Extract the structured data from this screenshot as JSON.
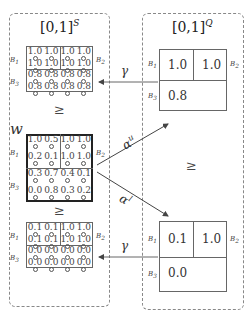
{
  "left_panel": {
    "title": "[0,1]",
    "title_sup": "S",
    "top_grid": {
      "rows": [
        [
          "1.0",
          "1.0",
          "1.0",
          "1.0"
        ],
        [
          "1.0",
          "1.0",
          "1.0",
          "1.0"
        ],
        [
          "0.8",
          "0.8",
          "0.8",
          "0.8"
        ],
        [
          "0.8",
          "0.8",
          "0.8",
          "0.8"
        ]
      ]
    },
    "leq_1": "≥",
    "w_label": "w",
    "w_grid": {
      "rows": [
        [
          "1.0",
          "0.5",
          "1.0",
          "1.0"
        ],
        [
          "0.2",
          "0.1",
          "1.0",
          "1.0"
        ],
        [
          "0.3",
          "0.7",
          "0.4",
          "0.1"
        ],
        [
          "0.0",
          "0.8",
          "0.3",
          "0.2"
        ]
      ]
    },
    "leq_2": "≥",
    "bottom_grid": {
      "rows": [
        [
          "0.1",
          "0.1",
          "1.0",
          "1.0"
        ],
        [
          "0.1",
          "0.1",
          "1.0",
          "1.0"
        ],
        [
          "0.0",
          "0.0",
          "0.0",
          "0.0"
        ],
        [
          "0.0",
          "0.0",
          "0.0",
          "0.0"
        ]
      ]
    },
    "block_labels": {
      "b1": "B",
      "b1_sub": "1",
      "b2": "B",
      "b2_sub": "2",
      "b3": "B",
      "b3_sub": "3"
    }
  },
  "right_panel": {
    "title": "[0,1]",
    "title_sup": "Q",
    "top_grid": {
      "b1": "1.0",
      "b2": "1.0",
      "b3": "0.8"
    },
    "leq": "≥",
    "bottom_grid": {
      "b1": "0.1",
      "b2": "1.0",
      "b3": "0.0"
    }
  },
  "arrows": {
    "gamma_top": "γ",
    "gamma_bottom": "γ",
    "alpha_u": "α",
    "alpha_u_sup": "u",
    "alpha_l": "α",
    "alpha_l_sup": "l"
  }
}
